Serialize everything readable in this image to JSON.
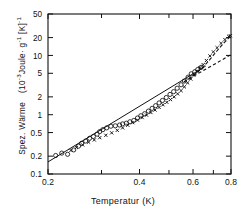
{
  "chart_data": {
    "type": "scatter",
    "title": "",
    "xlabel": "Temperatur   (K)",
    "ylabel": "Spez. Wärme  (10-3Joule· g-1 [K]-1",
    "ylabel_parts": {
      "name": "Spez. Wärme",
      "unit_open": "(10",
      "unit_exp1": "-3",
      "unit_mid": "Joule· g",
      "unit_exp2": "-1",
      "unit_brk": " [K]",
      "unit_exp3": "-1"
    },
    "xscale": "log",
    "yscale": "log",
    "xlim": [
      0.2,
      0.8
    ],
    "ylim": [
      0.1,
      50
    ],
    "grid": false,
    "legend": "none",
    "xticks": [
      0.2,
      0.4,
      0.6,
      0.8
    ],
    "xticklabels": [
      "0.2",
      "0.4",
      "0.6",
      "0.8"
    ],
    "xminorticks": [
      0.3,
      0.5,
      0.7
    ],
    "yticks": [
      0.1,
      0.2,
      0.5,
      1,
      2,
      5,
      10,
      20,
      50
    ],
    "yticklabels": [
      "0.1",
      "0.2",
      "0.5",
      "1",
      "2",
      "5",
      "10",
      "20",
      "50"
    ],
    "series": [
      {
        "name": "open-circles",
        "marker": "o",
        "filled": false,
        "points": [
          [
            0.212,
            0.205
          ],
          [
            0.222,
            0.225
          ],
          [
            0.232,
            0.215
          ],
          [
            0.243,
            0.255
          ],
          [
            0.252,
            0.295
          ],
          [
            0.258,
            0.33
          ],
          [
            0.266,
            0.36
          ],
          [
            0.274,
            0.4
          ],
          [
            0.282,
            0.43
          ],
          [
            0.29,
            0.47
          ],
          [
            0.296,
            0.52
          ],
          [
            0.303,
            0.56
          ],
          [
            0.312,
            0.6
          ],
          [
            0.322,
            0.64
          ],
          [
            0.333,
            0.65
          ],
          [
            0.344,
            0.67
          ],
          [
            0.352,
            0.7
          ],
          [
            0.362,
            0.72
          ],
          [
            0.372,
            0.76
          ],
          [
            0.383,
            0.8
          ],
          [
            0.394,
            0.88
          ],
          [
            0.404,
            0.96
          ],
          [
            0.416,
            1.04
          ],
          [
            0.428,
            1.15
          ],
          [
            0.44,
            1.28
          ],
          [
            0.452,
            1.42
          ],
          [
            0.464,
            1.58
          ],
          [
            0.476,
            1.74
          ],
          [
            0.49,
            1.95
          ],
          [
            0.504,
            2.2
          ],
          [
            0.518,
            2.45
          ],
          [
            0.532,
            2.8
          ],
          [
            0.548,
            3.2
          ],
          [
            0.562,
            3.7
          ],
          [
            0.578,
            4.3
          ],
          [
            0.592,
            4.9
          ],
          [
            0.608,
            5.3
          ],
          [
            0.622,
            5.8
          ],
          [
            0.638,
            6.3
          ]
        ]
      },
      {
        "name": "cross-points",
        "marker": "x",
        "filled": true,
        "points": [
          [
            0.238,
            0.25
          ],
          [
            0.248,
            0.28
          ],
          [
            0.26,
            0.31
          ],
          [
            0.272,
            0.345
          ],
          [
            0.284,
            0.375
          ],
          [
            0.296,
            0.41
          ],
          [
            0.31,
            0.45
          ],
          [
            0.324,
            0.495
          ],
          [
            0.338,
            0.545
          ],
          [
            0.352,
            0.6
          ],
          [
            0.366,
            0.665
          ],
          [
            0.38,
            0.735
          ],
          [
            0.394,
            0.81
          ],
          [
            0.408,
            0.895
          ],
          [
            0.422,
            0.985
          ],
          [
            0.436,
            1.09
          ],
          [
            0.45,
            1.2
          ],
          [
            0.464,
            1.33
          ],
          [
            0.478,
            1.47
          ],
          [
            0.492,
            1.62
          ],
          [
            0.506,
            1.8
          ],
          [
            0.52,
            2.0
          ],
          [
            0.534,
            2.25
          ],
          [
            0.548,
            2.55
          ],
          [
            0.562,
            2.95
          ],
          [
            0.576,
            3.45
          ],
          [
            0.59,
            4.0
          ],
          [
            0.604,
            4.7
          ],
          [
            0.618,
            5.4
          ],
          [
            0.632,
            6.2
          ],
          [
            0.648,
            7.0
          ],
          [
            0.664,
            8.2
          ],
          [
            0.682,
            9.8
          ],
          [
            0.7,
            11.5
          ],
          [
            0.72,
            13.5
          ],
          [
            0.742,
            16.0
          ],
          [
            0.764,
            18.5
          ],
          [
            0.786,
            21.0
          ],
          [
            0.796,
            21.5
          ]
        ]
      }
    ],
    "fit_lines": [
      {
        "name": "solid-power-law",
        "style": "solid",
        "points": [
          [
            0.2,
            0.16
          ],
          [
            0.66,
            6.6
          ]
        ]
      },
      {
        "name": "dashed-extrapolation",
        "style": "dashed",
        "points": [
          [
            0.56,
            3.6
          ],
          [
            0.8,
            10.3
          ]
        ]
      },
      {
        "name": "dashed-upturn-curve",
        "style": "dashed",
        "points": [
          [
            0.56,
            3.55
          ],
          [
            0.6,
            4.5
          ],
          [
            0.64,
            6.0
          ],
          [
            0.68,
            8.4
          ],
          [
            0.72,
            12.0
          ],
          [
            0.76,
            16.5
          ],
          [
            0.8,
            21.5
          ]
        ]
      }
    ]
  }
}
